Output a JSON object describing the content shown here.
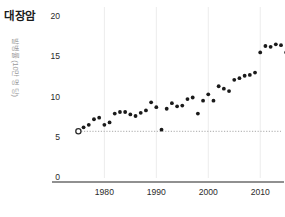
{
  "chart": {
    "title": "대장암",
    "ylabel": "발병률 (10만 명 당)",
    "xlabel": ""
  },
  "chart_data": {
    "type": "scatter",
    "title": "대장암",
    "xlabel": "",
    "ylabel": "발병률 (10만 명 당)",
    "xlim": [
      1973,
      2014
    ],
    "ylim": [
      0,
      20
    ],
    "xticks": [
      1980,
      1990,
      2000,
      2010
    ],
    "xtick_labels": [
      "1980",
      "1990",
      "2000",
      "2010"
    ],
    "yticks": [
      0,
      5,
      10,
      15,
      20
    ],
    "ytick_labels": [
      "0",
      "5",
      "10",
      "15",
      "20"
    ],
    "grid": "vertical-only",
    "legend": null,
    "marker_color": "#1a1a1a",
    "points": [
      {
        "x": 1975,
        "y": 5.8
      },
      {
        "x": 1976,
        "y": 6.3
      },
      {
        "x": 1977,
        "y": 6.6
      },
      {
        "x": 1978,
        "y": 7.3
      },
      {
        "x": 1979,
        "y": 7.5
      },
      {
        "x": 1980,
        "y": 6.6
      },
      {
        "x": 1981,
        "y": 6.9
      },
      {
        "x": 1982,
        "y": 8.0
      },
      {
        "x": 1983,
        "y": 8.2
      },
      {
        "x": 1984,
        "y": 8.2
      },
      {
        "x": 1985,
        "y": 7.9
      },
      {
        "x": 1986,
        "y": 7.7
      },
      {
        "x": 1987,
        "y": 8.1
      },
      {
        "x": 1988,
        "y": 8.4
      },
      {
        "x": 1989,
        "y": 9.4
      },
      {
        "x": 1990,
        "y": 8.8
      },
      {
        "x": 1991,
        "y": 6.0
      },
      {
        "x": 1992,
        "y": 8.6
      },
      {
        "x": 1993,
        "y": 9.3
      },
      {
        "x": 1994,
        "y": 8.9
      },
      {
        "x": 1995,
        "y": 9.0
      },
      {
        "x": 1996,
        "y": 9.8
      },
      {
        "x": 1997,
        "y": 10.0
      },
      {
        "x": 1998,
        "y": 8.0
      },
      {
        "x": 1999,
        "y": 9.6
      },
      {
        "x": 2000,
        "y": 10.4
      },
      {
        "x": 2001,
        "y": 9.6
      },
      {
        "x": 2002,
        "y": 11.4
      },
      {
        "x": 2003,
        "y": 11.1
      },
      {
        "x": 2004,
        "y": 10.8
      },
      {
        "x": 2005,
        "y": 12.2
      },
      {
        "x": 2006,
        "y": 12.4
      },
      {
        "x": 2007,
        "y": 12.7
      },
      {
        "x": 2008,
        "y": 12.8
      },
      {
        "x": 2009,
        "y": 13.1
      },
      {
        "x": 2010,
        "y": 15.6
      },
      {
        "x": 2011,
        "y": 16.4
      },
      {
        "x": 2012,
        "y": 16.3
      },
      {
        "x": 2013,
        "y": 16.6
      },
      {
        "x": 2014,
        "y": 16.5
      },
      {
        "x": 2015,
        "y": 15.6
      },
      {
        "x": 2016,
        "y": 16.2
      }
    ],
    "highlight_start": {
      "x": 1975,
      "y": 5.8,
      "style": "open-circle"
    },
    "highlight_end": {
      "x": 2017,
      "y": 17.5,
      "style": "open-circle"
    },
    "reference_line_y": 5.8,
    "reference_line_style": "dotted",
    "drop_line": {
      "x": 2017,
      "from_y": 17.5,
      "to_y": 0,
      "style": "solid"
    }
  }
}
